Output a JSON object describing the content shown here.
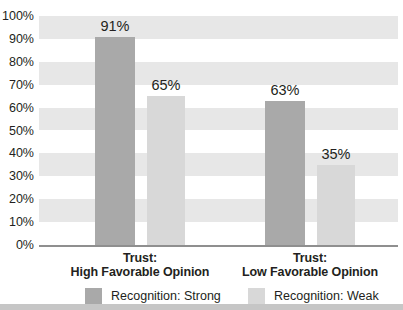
{
  "chart_data": {
    "type": "bar",
    "title": "",
    "categories": [
      "Trust: High Favorable Opinion",
      "Trust: Low Favorable Opinion"
    ],
    "groups": [
      {
        "line1": "Trust:",
        "line2": "High Favorable Opinion"
      },
      {
        "line1": "Trust:",
        "line2": "Low Favorable Opinion"
      }
    ],
    "series": [
      {
        "name": "Recognition: Strong",
        "color": "#a9a9a9",
        "values": [
          91,
          63
        ],
        "labels": [
          "91%",
          "63%"
        ]
      },
      {
        "name": "Recognition: Weak",
        "color": "#d8d8d8",
        "values": [
          65,
          35
        ],
        "labels": [
          "65%",
          "35%"
        ]
      }
    ],
    "yticks": [
      "100%",
      "90%",
      "80%",
      "70%",
      "60%",
      "50%",
      "40%",
      "30%",
      "20%",
      "10%",
      "0%"
    ],
    "ylim": [
      0,
      100
    ],
    "grid": "horizontal-stripes",
    "legend_position": "bottom",
    "stripe_color": "#e7e7e7",
    "axis_line_color": "#8f8f8f",
    "text_color": "#231f20"
  },
  "legend": {
    "items": [
      {
        "label": "Recognition: Strong",
        "color": "#a9a9a9"
      },
      {
        "label": "Recognition: Weak",
        "color": "#d8d8d8"
      }
    ]
  }
}
